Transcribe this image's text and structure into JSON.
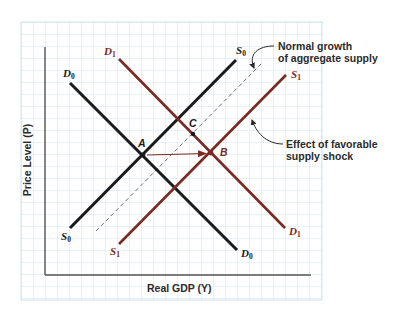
{
  "diagram": {
    "title": "",
    "axes": {
      "x_label": "Real GDP (Y)",
      "y_label": "Price Level (P)"
    },
    "colors": {
      "grid": "#cfe3f0",
      "axis": "#555555",
      "original_curves": "#1a1a1a",
      "shifted_curves": "#7a2a22",
      "dashed": "#6a6a6a",
      "text": "#2b2b2b"
    },
    "curves": [
      {
        "id": "D0",
        "label_main": "D",
        "label_sub": "0",
        "kind": "demand",
        "color": "#1a1a1a",
        "from": [
          70,
          83
        ],
        "to": [
          237,
          250
        ]
      },
      {
        "id": "D1",
        "label_main": "D",
        "label_sub": "1",
        "kind": "demand",
        "color": "#7a2a22",
        "from": [
          119,
          59
        ],
        "to": [
          285,
          228
        ]
      },
      {
        "id": "S0",
        "label_main": "S",
        "label_sub": "0",
        "kind": "supply",
        "color": "#1a1a1a",
        "from": [
          70,
          228
        ],
        "to": [
          236,
          60
        ]
      },
      {
        "id": "S1",
        "label_main": "S",
        "label_sub": "1",
        "kind": "supply",
        "color": "#7a2a22",
        "from": [
          119,
          244
        ],
        "to": [
          286,
          75
        ]
      },
      {
        "id": "dashed",
        "kind": "normal-growth-supply",
        "color": "#6a6a6a",
        "from": [
          96,
          231
        ],
        "to": [
          262,
          63
        ]
      }
    ],
    "points": [
      {
        "id": "A",
        "label": "A",
        "x": 143,
        "y": 155
      },
      {
        "id": "B",
        "label": "B",
        "x": 211,
        "y": 153
      },
      {
        "id": "C",
        "label": "C",
        "x": 193,
        "y": 134
      }
    ],
    "annotations": {
      "normal_growth_line1": "Normal growth",
      "normal_growth_line2": "of aggregate supply",
      "favorable_shock_line1": "Effect of favorable",
      "favorable_shock_line2": "supply shock"
    },
    "labels": {
      "D0_main": "D",
      "D0_sub": "0",
      "D1_main": "D",
      "D1_sub": "1",
      "S0_main": "S",
      "S0_sub": "0",
      "S1_main": "S",
      "S1_sub": "1"
    }
  }
}
